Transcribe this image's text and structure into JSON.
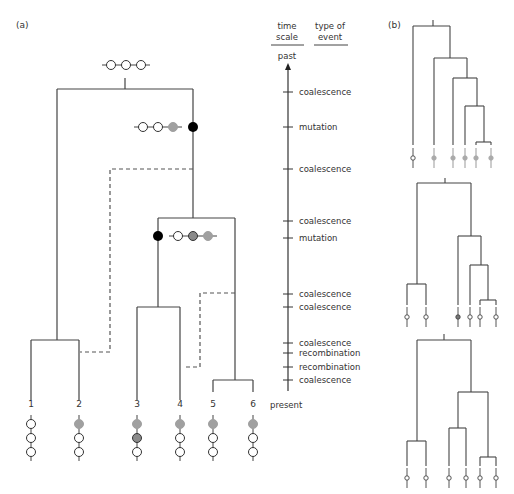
{
  "panel_a": {
    "label": "(a)",
    "header_time_scale_line1": "time",
    "header_time_scale_line2": "scale",
    "header_event_line1": "type of",
    "header_event_line2": "event",
    "past_label": "past",
    "present_label": "present",
    "events": [
      "coalescence",
      "mutation",
      "coalescence",
      "coalescence",
      "mutation",
      "coalescence",
      "coalescence",
      "coalescence",
      "recombination",
      "recombination",
      "coalescence"
    ],
    "leaf_labels": [
      "1",
      "2",
      "3",
      "4",
      "5",
      "6"
    ],
    "ancestral_haplotype": [
      "white",
      "white",
      "white"
    ],
    "mutation1_haplotype": [
      "white",
      "white",
      "grey"
    ],
    "mutation2_haplotype": [
      "white",
      "darkgrey",
      "grey"
    ],
    "leaf_haplotypes": [
      [
        "white",
        "white",
        "white"
      ],
      [
        "grey",
        "white",
        "white"
      ],
      [
        "grey",
        "darkgrey",
        "white"
      ],
      [
        "grey",
        "white",
        "white"
      ],
      [
        "grey",
        "white",
        "white"
      ],
      [
        "grey",
        "white",
        "white"
      ]
    ]
  },
  "panel_b": {
    "label": "(b)"
  },
  "colors": {
    "line": "#444444",
    "grey_allele": "#a0a0a0",
    "darkgrey_allele": "#8a8a8a",
    "mutation_dot": "#000000"
  }
}
